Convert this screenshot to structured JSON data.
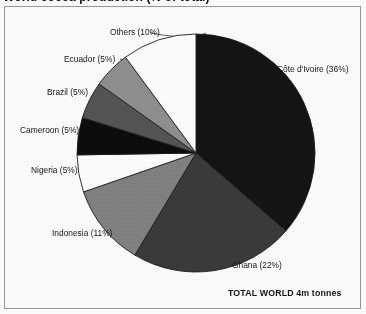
{
  "figure": {
    "title": "World cocoa production (% of total)",
    "title_note": "bold heading clipped at top edge of the scan",
    "frame_border_color": "#9a9a9a",
    "background_color": "#ffffff",
    "footnote": "TOTAL WORLD 4m tonnes"
  },
  "chart_data": {
    "type": "pie",
    "title": "World cocoa production (% of total)",
    "xlabel": "",
    "ylabel": "",
    "unit": "%",
    "total_label": "TOTAL WORLD 4m tonnes",
    "total_value": "4m tonnes",
    "start_angle_deg": 0,
    "direction": "clockwise",
    "legend": "none (labels placed outside slices with leader lines)",
    "grid": false,
    "categories": [
      "Côte d'Ivoire",
      "Ghana",
      "Indonesia",
      "Nigeria",
      "Cameroon",
      "Brazil",
      "Ecuador",
      "Others"
    ],
    "values": [
      36,
      22,
      11,
      5,
      5,
      5,
      5,
      10
    ],
    "colors": [
      "#141414",
      "#3b3b3b",
      "#828282",
      "#ffffff",
      "#0d0d0d",
      "#555555",
      "#909090",
      "#ffffff"
    ],
    "slices": [
      {
        "label": "Côte d'Ivoire",
        "value": 36,
        "display": "Côte d'Ivoire (36%)",
        "color": "#141414"
      },
      {
        "label": "Ghana",
        "value": 22,
        "display": "Ghana (22%)",
        "color": "#3b3b3b"
      },
      {
        "label": "Indonesia",
        "value": 11,
        "display": "Indonesia (11%)",
        "color": "#828282"
      },
      {
        "label": "Nigeria",
        "value": 5,
        "display": "Nigeria (5%)",
        "color": "#ffffff"
      },
      {
        "label": "Cameroon",
        "value": 5,
        "display": "Cameroon (5%)",
        "color": "#0d0d0d"
      },
      {
        "label": "Brazil",
        "value": 5,
        "display": "Brazil (5%)",
        "color": "#555555"
      },
      {
        "label": "Ecuador",
        "value": 5,
        "display": "Ecuador (5%)",
        "color": "#909090"
      },
      {
        "label": "Others",
        "value": 10,
        "display": "Others (10%)",
        "color": "#ffffff"
      }
    ]
  },
  "labels": {
    "cote_divoire": "Côte d'Ivoire (36%)",
    "ghana": "Ghana (22%)",
    "indonesia": "Indonesia (11%)",
    "nigeria": "Nigeria (5%)",
    "cameroon": "Cameroon (5%)",
    "brazil": "Brazil (5%)",
    "ecuador": "Ecuador (5%)",
    "others": "Others (10%)",
    "total": "TOTAL WORLD 4m tonnes"
  }
}
